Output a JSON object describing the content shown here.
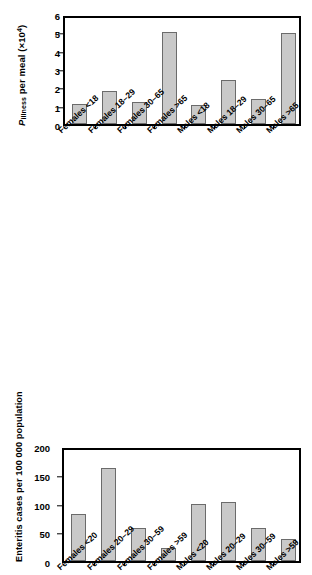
{
  "chart_data": [
    {
      "id": "p-illness-per-meal",
      "type": "bar",
      "title": "",
      "xlabel": "",
      "ylabel": "P illness per meal (×10⁴)",
      "ylabel_parts": {
        "italic": "P",
        "subscript": "illness",
        "rest": " per meal (×10",
        "superscript": "4",
        "tail": ")"
      },
      "categories": [
        "Females <18",
        "Females 18–29",
        "Females 30–65",
        "Females >65",
        "Males <18",
        "Males 18–29",
        "Males 30–65",
        "Males >65"
      ],
      "values": [
        1.1,
        1.8,
        1.2,
        5.0,
        1.05,
        2.4,
        1.35,
        4.95
      ],
      "ylim": [
        0,
        6
      ],
      "yticks": [
        0,
        1,
        2,
        3,
        4,
        5,
        6
      ],
      "ytick_labels": [
        "0",
        "1",
        "2",
        "3",
        "4",
        "5",
        "6"
      ],
      "grid": false,
      "legend": false
    },
    {
      "id": "enteritis-cases",
      "type": "bar",
      "title": "",
      "xlabel": "",
      "ylabel": "Enteritis cases per 100 000 population",
      "categories": [
        "Females <20",
        "Females 20–29",
        "Females 30–59",
        "Females >59",
        "Males <20",
        "Males 20–29",
        "Males 30–59",
        "Males >59"
      ],
      "values": [
        81,
        161,
        57,
        22,
        99,
        103,
        57,
        38
      ],
      "ylim": [
        0,
        200
      ],
      "yticks": [
        0,
        50,
        100,
        150,
        200
      ],
      "ytick_labels": [
        "0",
        "50",
        "100",
        "150",
        "200"
      ],
      "grid": false,
      "legend": false
    }
  ],
  "colors": {
    "bar_fill": "#c9c9c9",
    "bar_stroke": "#6b6b6b",
    "axis": "#000000",
    "background": "#ffffff"
  }
}
